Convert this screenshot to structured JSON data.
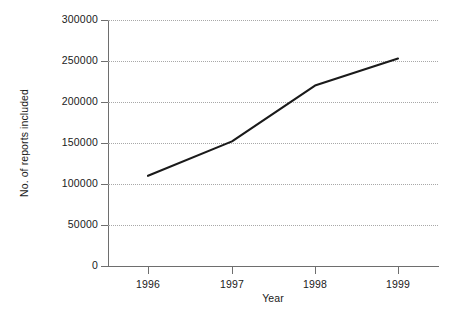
{
  "chart_data": {
    "type": "line",
    "title": "",
    "xlabel": "Year",
    "ylabel": "No. of reports included",
    "categories": [
      "1996",
      "1997",
      "1998",
      "1999"
    ],
    "x": [
      1996,
      1997,
      1998,
      1999
    ],
    "values": [
      110000,
      152000,
      220000,
      253000
    ],
    "series": [
      {
        "name": "No. of reports included",
        "values": [
          110000,
          152000,
          220000,
          253000
        ]
      }
    ],
    "ylim": [
      0,
      300000
    ],
    "xlim": [
      1995.5,
      1999.5
    ],
    "yticks": [
      0,
      50000,
      100000,
      150000,
      200000,
      250000,
      300000
    ],
    "ytick_labels": [
      "0",
      "50000",
      "100000",
      "150000",
      "200000",
      "250000",
      "300000"
    ],
    "xticks": [
      1996,
      1997,
      1998,
      1999
    ],
    "xtick_labels": [
      "1996",
      "1997",
      "1998",
      "1999"
    ],
    "grid": true,
    "grid_axis": "y",
    "grid_style": "dotted",
    "legend": false,
    "legend_position": "none",
    "line_color": "#1a1a1a",
    "grid_color": "#a8a8a8",
    "axis_color": "#6e6e6e",
    "background_color": "#ffffff",
    "markers": false
  }
}
